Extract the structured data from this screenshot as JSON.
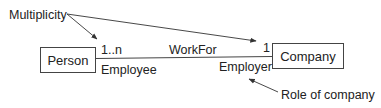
{
  "diagram": {
    "type": "UML class association",
    "classes": [
      {
        "id": "person",
        "name": "Person"
      },
      {
        "id": "company",
        "name": "Company"
      }
    ],
    "association": {
      "name": "WorkFor",
      "source_multiplicity": "1..n",
      "target_multiplicity": "1",
      "source_role": "Employee",
      "target_role": "Employer"
    },
    "annotations": {
      "multiplicity": "Multiplicity",
      "role": "Role of company"
    },
    "colors": {
      "stroke": "#333333",
      "text": "#222222",
      "background": "#ffffff"
    }
  }
}
